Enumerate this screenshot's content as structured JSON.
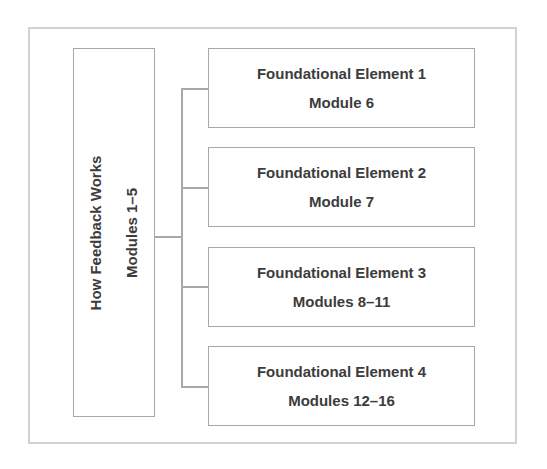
{
  "diagram": {
    "type": "tree-bracket",
    "colors": {
      "frame_border": "#d2d2d2",
      "box_border": "#a8a8a8",
      "connector": "#a8a8a8",
      "text": "#3c3c3c",
      "background": "#ffffff"
    },
    "root": {
      "title": "How Feedback Works",
      "subtitle": "Modules 1–5"
    },
    "children": [
      {
        "title": "Foundational Element 1",
        "subtitle": "Module 6"
      },
      {
        "title": "Foundational Element 2",
        "subtitle": "Module 7"
      },
      {
        "title": "Foundational Element 3",
        "subtitle": "Modules 8–11"
      },
      {
        "title": "Foundational Element 4",
        "subtitle": "Modules 12–16"
      }
    ]
  }
}
